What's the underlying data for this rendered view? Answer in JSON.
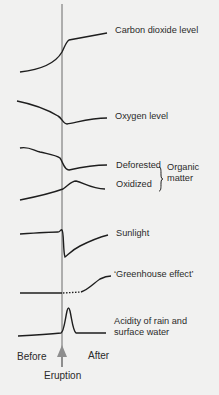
{
  "colors": {
    "background": "#f1f1f0",
    "curve": "#1e1e1e",
    "axis_line": "#6a6a6a",
    "arrow": "#8e8e8e",
    "text": "#2a2a2a"
  },
  "curves": [
    {
      "id": "co2",
      "label": "Carbon dioxide level",
      "trend_after_eruption": "sharp rise then steady increase"
    },
    {
      "id": "oxygen",
      "label": "Oxygen level",
      "trend_after_eruption": "sharp drop then slow recovery"
    },
    {
      "id": "deforested",
      "label": "Deforested",
      "trend_after_eruption": "sharp drop then slight recovery"
    },
    {
      "id": "oxidized",
      "label": "Oxidized",
      "trend_after_eruption": "peak then decline"
    },
    {
      "id": "sunlight",
      "label": "Sunlight",
      "trend_after_eruption": "brief spike, sharp dip, recovery"
    },
    {
      "id": "greenhouse",
      "label": "‘Greenhouse effect’",
      "trend_after_eruption": "dotted uncertain period then rise"
    },
    {
      "id": "acidity",
      "label_line1": "Acidity of rain and",
      "label_line2": "surface water",
      "trend_after_eruption": "sharp short peak then return"
    }
  ],
  "bracket_group": {
    "label_line1": "Organic",
    "label_line2": "matter",
    "members": [
      "Deforested",
      "Oxidized"
    ]
  },
  "timeline": {
    "before_label": "Before",
    "after_label": "After",
    "event_label": "Eruption"
  }
}
